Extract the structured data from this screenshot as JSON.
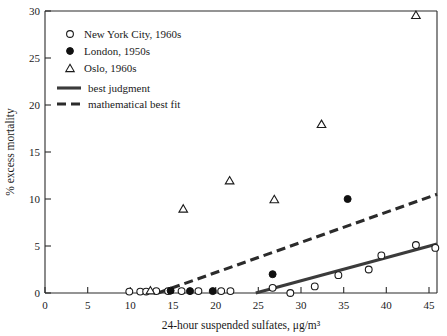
{
  "chart_data": {
    "type": "scatter",
    "title": "",
    "xlabel": "24-hour suspended sulfates, μg/m³",
    "ylabel": "% excess mortality",
    "xlim": [
      0,
      46.5
    ],
    "ylim": [
      0,
      30
    ],
    "xticks": [
      0,
      5,
      10,
      15,
      20,
      25,
      30,
      35,
      40,
      45
    ],
    "yticks": [
      0,
      5,
      10,
      15,
      20,
      25,
      30
    ],
    "xtick_labels": [
      "0",
      "5",
      "10",
      "15",
      "20",
      "25",
      "30",
      "35",
      "40",
      "45"
    ],
    "ytick_labels": [
      "0",
      "5",
      "10",
      "15",
      "20",
      "25",
      "30"
    ],
    "grid": false,
    "legend_position": "upper left",
    "series": [
      {
        "name": "New York City, 1960s",
        "marker": "open-circle",
        "color": "#1a1a1a",
        "points": [
          [
            10.0,
            0.15
          ],
          [
            11.3,
            0.15
          ],
          [
            12.0,
            0.15
          ],
          [
            13.2,
            0.2
          ],
          [
            14.6,
            0.2
          ],
          [
            16.2,
            0.2
          ],
          [
            18.2,
            0.2
          ],
          [
            20.9,
            0.2
          ],
          [
            22.0,
            0.2
          ],
          [
            27.0,
            0.55
          ],
          [
            29.1,
            0.0
          ],
          [
            32.0,
            0.7
          ],
          [
            34.8,
            1.9
          ],
          [
            38.4,
            2.5
          ],
          [
            39.9,
            4.0
          ],
          [
            44.0,
            5.1
          ],
          [
            46.3,
            4.8
          ]
        ]
      },
      {
        "name": "London, 1950s",
        "marker": "filled-circle",
        "color": "#101010",
        "points": [
          [
            14.9,
            0.25
          ],
          [
            17.2,
            0.2
          ],
          [
            19.9,
            0.2
          ],
          [
            27.0,
            2.0
          ],
          [
            35.9,
            10.0
          ]
        ]
      },
      {
        "name": "Oslo, 1960s",
        "marker": "open-triangle",
        "color": "#1a1a1a",
        "points": [
          [
            12.5,
            0.3
          ],
          [
            16.4,
            9.0
          ],
          [
            21.9,
            12.0
          ],
          [
            27.2,
            10.0
          ],
          [
            32.8,
            18.0
          ],
          [
            44.0,
            29.6
          ]
        ]
      }
    ],
    "lines": [
      {
        "name": "best judgment",
        "style": "solid",
        "color": "#3b3b3b",
        "points": [
          [
            25.0,
            0.0
          ],
          [
            46.5,
            5.2
          ]
        ]
      },
      {
        "name": "mathematical best fit",
        "style": "dashed",
        "color": "#2b2b2b",
        "points": [
          [
            13.4,
            0.0
          ],
          [
            46.5,
            10.5
          ]
        ]
      }
    ],
    "legend_entries": [
      {
        "label": "New York City, 1960s",
        "marker": "open-circle"
      },
      {
        "label": "London, 1950s",
        "marker": "filled-circle"
      },
      {
        "label": "Oslo, 1960s",
        "marker": "open-triangle"
      },
      {
        "label": "best judgment",
        "marker": "solid-line"
      },
      {
        "label": "mathematical best fit",
        "marker": "dashed-line"
      }
    ]
  }
}
